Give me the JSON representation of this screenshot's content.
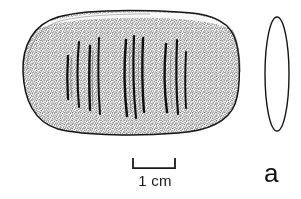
{
  "figure": {
    "label": "a",
    "caption_text": "1 cm",
    "background_color": "#ffffff",
    "ink_color": "#1a1a1a"
  },
  "scale_bar": {
    "length_label": "1 cm",
    "unit": "cm",
    "value": 1,
    "x_start": 133,
    "x_end": 175,
    "y_baseline": 168,
    "tick_height": 10
  },
  "artifact_plan_view": {
    "name": "incised-stone-artifact-plan-view",
    "shape": "rounded-loaf",
    "bounds": {
      "x": 20,
      "y": 12,
      "width": 220,
      "height": 123
    },
    "shading": "stipple",
    "incised_line_count": 10,
    "incised_line_groups": [
      {
        "group": 1,
        "count": 4,
        "x_range": [
          66,
          100
        ]
      },
      {
        "group": 2,
        "count": 3,
        "x_range": [
          120,
          140
        ]
      },
      {
        "group": 3,
        "count": 3,
        "x_range": [
          160,
          183
        ]
      }
    ]
  },
  "artifact_profile_view": {
    "name": "incised-stone-artifact-side-profile",
    "shape": "narrow-ellipse",
    "bounds": {
      "x": 265,
      "y": 17,
      "width": 24,
      "height": 114
    }
  }
}
